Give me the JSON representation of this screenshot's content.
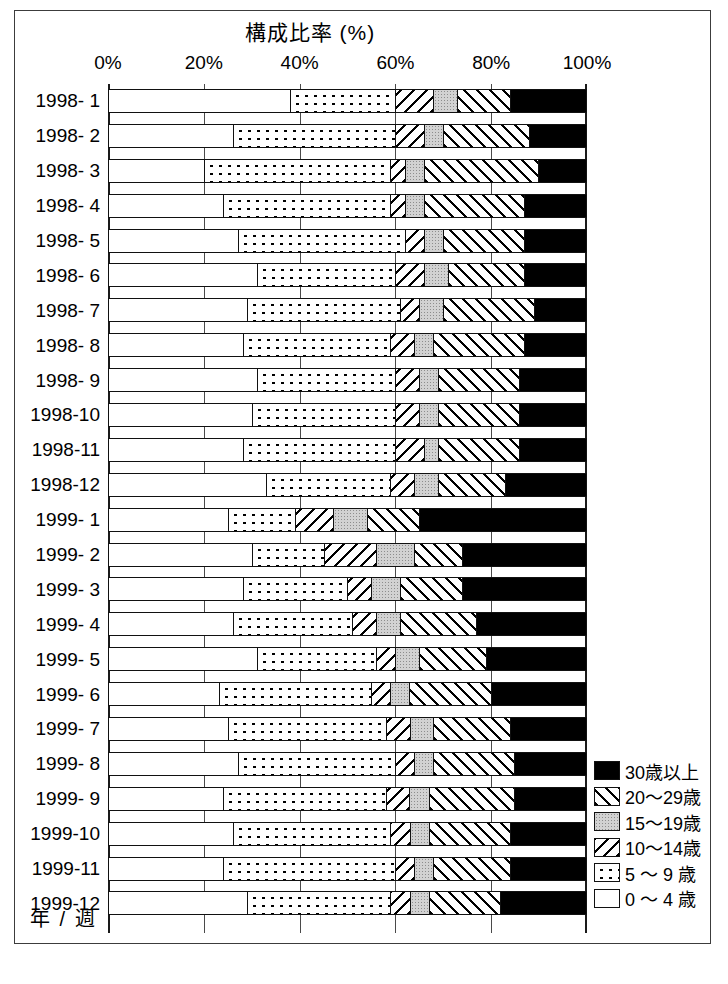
{
  "title": "構成比率 (%)",
  "axis_caption": "年 / 週",
  "x_ticks": [
    "0%",
    "20%",
    "40%",
    "60%",
    "80%",
    "100%"
  ],
  "legend": {
    "items": [
      {
        "label": "30歳以上",
        "pattern": "p-black"
      },
      {
        "label": "20〜29歳",
        "pattern": "p-diagup"
      },
      {
        "label": "15〜19歳",
        "pattern": "p-gray"
      },
      {
        "label": "10〜14歳",
        "pattern": "p-diagdown"
      },
      {
        "label": "5 〜 9 歳",
        "pattern": "p-dots"
      },
      {
        "label": "0 〜 4 歳",
        "pattern": "p-white"
      }
    ]
  },
  "chart_data": {
    "type": "bar",
    "orientation": "horizontal",
    "stacked": true,
    "normalized": true,
    "title": "構成比率 (%)",
    "xlabel": "構成比率 (%)",
    "ylabel": "年 / 週",
    "xlim": [
      0,
      100
    ],
    "xticks": [
      0,
      20,
      40,
      60,
      80,
      100
    ],
    "grid": true,
    "legend_position": "bottom-right",
    "categories": [
      "1998- 1",
      "1998- 2",
      "1998- 3",
      "1998- 4",
      "1998- 5",
      "1998- 6",
      "1998- 7",
      "1998- 8",
      "1998- 9",
      "1998-10",
      "1998-11",
      "1998-12",
      "1999- 1",
      "1999- 2",
      "1999- 3",
      "1999- 4",
      "1999- 5",
      "1999- 6",
      "1999- 7",
      "1999- 8",
      "1999- 9",
      "1999-10",
      "1999-11",
      "1999-12"
    ],
    "series": [
      {
        "name": "0 〜 4 歳",
        "pattern": "p-white",
        "values": [
          38,
          26,
          20,
          24,
          27,
          31,
          29,
          28,
          31,
          30,
          28,
          33,
          25,
          30,
          28,
          26,
          31,
          23,
          25,
          27,
          24,
          26,
          24,
          29
        ]
      },
      {
        "name": "5 〜 9 歳",
        "pattern": "p-dots",
        "values": [
          22,
          34,
          39,
          35,
          35,
          29,
          32,
          31,
          29,
          30,
          32,
          26,
          14,
          15,
          22,
          25,
          25,
          32,
          33,
          33,
          34,
          33,
          36,
          30
        ]
      },
      {
        "name": "10〜14歳",
        "pattern": "p-diagdown",
        "values": [
          8,
          6,
          3,
          3,
          4,
          6,
          4,
          5,
          5,
          5,
          6,
          5,
          8,
          11,
          5,
          5,
          4,
          4,
          5,
          4,
          5,
          4,
          4,
          4
        ]
      },
      {
        "name": "15〜19歳",
        "pattern": "p-gray",
        "values": [
          5,
          4,
          4,
          4,
          4,
          5,
          5,
          4,
          4,
          4,
          3,
          5,
          7,
          8,
          6,
          5,
          5,
          4,
          5,
          4,
          4,
          4,
          4,
          4
        ]
      },
      {
        "name": "20〜29歳",
        "pattern": "p-diagup",
        "values": [
          11,
          18,
          24,
          21,
          17,
          16,
          19,
          19,
          17,
          17,
          17,
          14,
          11,
          10,
          13,
          16,
          14,
          17,
          16,
          17,
          18,
          17,
          16,
          15
        ]
      },
      {
        "name": "30歳以上",
        "pattern": "p-black",
        "values": [
          16,
          12,
          10,
          13,
          13,
          13,
          11,
          13,
          14,
          14,
          14,
          17,
          35,
          26,
          26,
          23,
          21,
          20,
          16,
          15,
          15,
          16,
          16,
          18
        ]
      }
    ],
    "segment_order_left_to_right": [
      "0 〜 4 歳",
      "5 〜 9 歳",
      "10〜14歳",
      "15〜19歳",
      "20〜29歳",
      "30歳以上"
    ]
  }
}
